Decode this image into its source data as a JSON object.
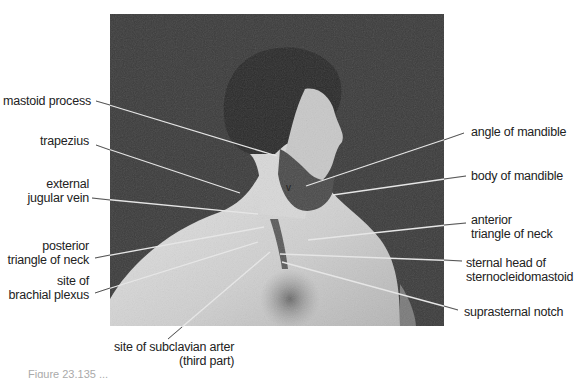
{
  "figure": {
    "photo_description": "Black-and-white photograph of a bearded man in right profile, bare shoulders and chest, with anatomical leader lines",
    "background_color": "#ffffff",
    "photo_background_color": "#3a3a3a",
    "label_color": "#222222",
    "leader_line_color": "#e8e8e8"
  },
  "labels_left": [
    {
      "id": "mastoid-process",
      "lines": [
        "mastoid process"
      ]
    },
    {
      "id": "trapezius",
      "lines": [
        "trapezius"
      ]
    },
    {
      "id": "external-jugular-vein",
      "lines": [
        "external",
        "jugular vein"
      ]
    },
    {
      "id": "posterior-triangle-of-neck",
      "lines": [
        "posterior",
        "triangle of neck"
      ]
    },
    {
      "id": "site-of-brachial-plexus",
      "lines": [
        "site of",
        "brachial plexus"
      ]
    }
  ],
  "labels_right": [
    {
      "id": "angle-of-mandible",
      "lines": [
        "angle of mandible"
      ]
    },
    {
      "id": "body-of-mandible",
      "lines": [
        "body of mandible"
      ]
    },
    {
      "id": "anterior-triangle-of-neck",
      "lines": [
        "anterior",
        "triangle of neck"
      ]
    },
    {
      "id": "sternal-head-of-sternocleidomastoid",
      "lines": [
        "sternal head of",
        "sternocleidomastoid"
      ]
    },
    {
      "id": "suprasternal-notch",
      "lines": [
        "suprasternal notch"
      ]
    }
  ],
  "labels_bottom": [
    {
      "id": "site-of-subclavian-artery",
      "lines": [
        "site of subclavian arter",
        "(third part)"
      ]
    }
  ],
  "photo_marker": "v",
  "caption": "Figure 23.135 ..."
}
